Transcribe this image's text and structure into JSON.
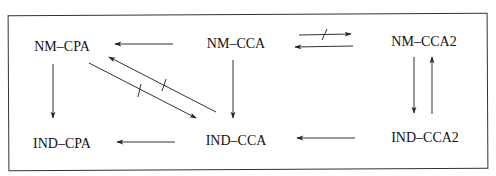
{
  "diagram": {
    "type": "security-notion-implications",
    "nodes": [
      {
        "id": "nm_cpa",
        "label": "NM–CPA",
        "x": 62,
        "y": 47
      },
      {
        "id": "nm_cca",
        "label": "NM–CCA",
        "x": 236,
        "y": 44
      },
      {
        "id": "nm_cca2",
        "label": "NM–CCA2",
        "x": 424,
        "y": 42
      },
      {
        "id": "ind_cpa",
        "label": "IND–CPA",
        "x": 62,
        "y": 144
      },
      {
        "id": "ind_cca",
        "label": "IND–CCA",
        "x": 236,
        "y": 141
      },
      {
        "id": "ind_cca2",
        "label": "IND–CCA2",
        "x": 425,
        "y": 138
      }
    ],
    "edges": [
      {
        "from": "nm_cca",
        "to": "nm_cpa",
        "separation": false
      },
      {
        "from": "nm_cpa",
        "to": "ind_cpa",
        "separation": false
      },
      {
        "from": "nm_cca",
        "to": "ind_cca",
        "separation": false
      },
      {
        "from": "ind_cca",
        "to": "ind_cpa",
        "separation": false
      },
      {
        "from": "ind_cca2",
        "to": "ind_cca",
        "separation": false
      },
      {
        "from": "nm_cca",
        "to": "nm_cca2",
        "separation": true
      },
      {
        "from": "nm_cca2",
        "to": "nm_cca",
        "separation": false
      },
      {
        "from": "nm_cca2",
        "to": "ind_cca2",
        "separation": false
      },
      {
        "from": "ind_cca2",
        "to": "nm_cca2",
        "separation": false
      },
      {
        "from": "nm_cpa",
        "to": "ind_cca",
        "separation": true
      },
      {
        "from": "ind_cca",
        "to": "nm_cpa",
        "separation": true
      }
    ],
    "colors": {
      "line": "#222222",
      "text": "#111111",
      "frame": "#333333"
    }
  }
}
